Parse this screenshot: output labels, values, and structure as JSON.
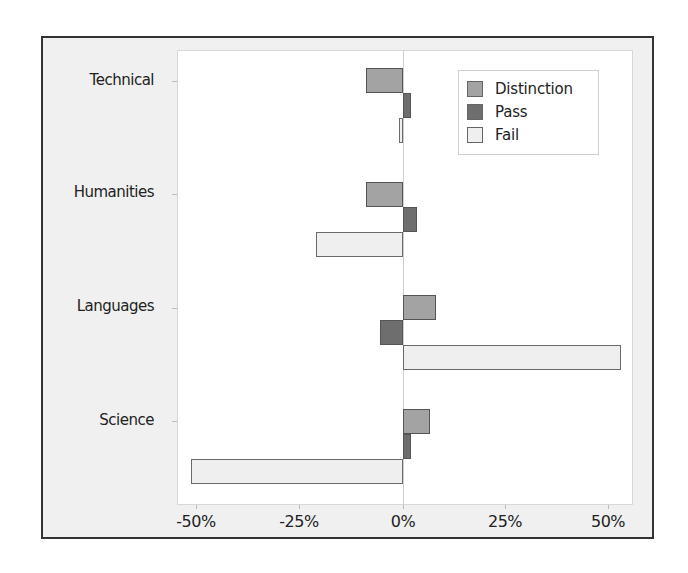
{
  "chart_data": {
    "type": "bar",
    "orientation": "horizontal",
    "title": "",
    "xlabel": "",
    "ylabel": "",
    "categories": [
      "Technical",
      "Humanities",
      "Languages",
      "Science"
    ],
    "series": [
      {
        "name": "Distinction",
        "color": "#a3a3a3",
        "values": [
          -9,
          -9,
          8,
          6.5
        ]
      },
      {
        "name": "Pass",
        "color": "#6e6e6e",
        "values": [
          2,
          3.5,
          -5.5,
          2
        ]
      },
      {
        "name": "Fail",
        "color": "#efefef",
        "values": [
          -1,
          -21,
          53,
          -51.5
        ]
      }
    ],
    "xlim": [
      -55,
      55
    ],
    "xticks": [
      -50,
      -25,
      0,
      25,
      50
    ],
    "xtick_labels": [
      "-50%",
      "-25%",
      "0%",
      "25%",
      "50%"
    ],
    "grid": false,
    "legend_position": "upper right",
    "zero_line": true
  },
  "legend": {
    "items": [
      {
        "label": "Distinction",
        "color": "#a3a3a3"
      },
      {
        "label": "Pass",
        "color": "#6e6e6e"
      },
      {
        "label": "Fail",
        "color": "#efefef"
      }
    ]
  },
  "yaxis": {
    "labels": [
      "Technical",
      "Humanities",
      "Languages",
      "Science"
    ]
  },
  "xaxis": {
    "labels": [
      "-50%",
      "-25%",
      "0%",
      "25%",
      "50%"
    ]
  }
}
